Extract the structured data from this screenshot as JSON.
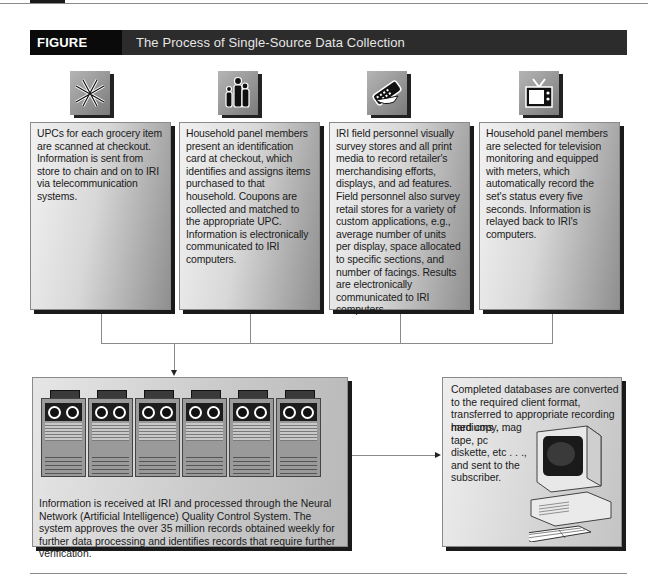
{
  "figure": {
    "label": "FIGURE 7.10",
    "title": "The Process of Single-Source Data Collection"
  },
  "colors": {
    "header_bg": "#2c2c2c",
    "label_bg": "#0a0a0a",
    "box_shadow": "#1a1a1a",
    "connector": "#8a8a8a"
  },
  "steps": [
    {
      "icon": "barcode-scanner-icon",
      "text": "UPCs for each grocery item are scanned at checkout. Information is sent from store to chain and on to IRI via telecommunication systems."
    },
    {
      "icon": "family-icon",
      "text": "Household panel members present an identification card at checkout, which identifies and assigns items purchased to that household. Coupons are collected and matched to the appropriate UPC. Information is electronically communicated to IRI computers."
    },
    {
      "icon": "handheld-device-icon",
      "text": "IRI field personnel visually survey stores and all print media to record retailer's merchandising efforts, displays, and ad features. Field personnel also survey retail stores for a variety of custom applications, e.g., average number of units per display, space allocated to specific sections, and number of facings. Results are electronically communicated to IRI computers."
    },
    {
      "icon": "television-icon",
      "text": "Household panel members are selected for television monitoring and equipped with meters, which automatically record the set's status every five seconds. Information is relayed back to IRI's computers."
    }
  ],
  "processing": {
    "icon": "server-rack-icon",
    "server_count": 6,
    "text": "Information is received at IRI and processed through the Neural Network (Artificial Intelligence) Quality Control System. The system approves the over 35 million records obtained weekly for further data processing and identifies records that require further verification."
  },
  "delivery": {
    "icon": "desktop-computer-icon",
    "text_top": "Completed databases are converted to the required client format, transferred to appropriate recording mediums . . .",
    "text_side": "hard copy, mag tape, pc diskette, etc . . ., and sent to the subscriber."
  }
}
